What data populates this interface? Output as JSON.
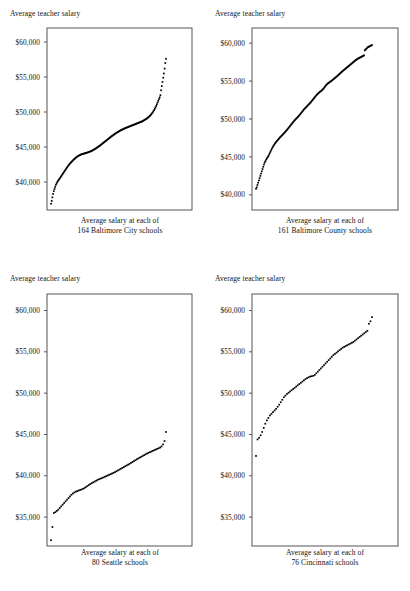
{
  "figure": {
    "background": "#ffffff",
    "ink": "#000000",
    "frame_color": "#555555",
    "panel_count": 4
  },
  "chart_data": [
    {
      "id": "baltimore-city",
      "type": "scatter",
      "title": "Average teacher salary",
      "ylabel": "Average teacher salary",
      "xlabel": "Average salary at each of 164 Baltimore City schools",
      "xlabel_line1": "Average salary at each of",
      "xlabel_line2": "164 Baltimore City schools",
      "n": 164,
      "city": "Baltimore City",
      "grid": false,
      "legend": "none",
      "ylim": [
        36000,
        62000
      ],
      "yticks": [
        40000,
        45000,
        50000,
        55000,
        60000
      ],
      "ytick_labels": [
        "$40,000",
        "$45,000",
        "$50,000",
        "$55,000",
        "$60,000"
      ],
      "x": [
        1,
        2,
        3,
        4,
        5,
        6,
        7,
        8,
        9,
        10,
        11,
        12,
        13,
        14,
        15,
        16,
        17,
        18,
        19,
        20,
        21,
        22,
        23,
        24,
        25,
        26,
        27,
        28,
        29,
        30,
        31,
        32,
        33,
        34,
        35,
        36,
        37,
        38,
        39,
        40,
        41,
        42,
        43,
        44,
        45,
        46,
        47,
        48,
        49,
        50,
        51,
        52,
        53,
        54,
        55,
        56,
        57,
        58,
        59,
        60,
        61,
        62,
        63,
        64,
        65,
        66,
        67,
        68,
        69,
        70,
        71,
        72,
        73,
        74,
        75,
        76,
        77,
        78,
        79,
        80,
        81,
        82,
        83,
        84,
        85,
        86,
        87,
        88,
        89,
        90,
        91,
        92,
        93,
        94,
        95,
        96,
        97,
        98,
        99,
        100,
        101,
        102,
        103,
        104,
        105,
        106,
        107,
        108,
        109,
        110,
        111,
        112,
        113,
        114,
        115,
        116,
        117,
        118,
        119,
        120,
        121,
        122,
        123,
        124,
        125,
        126,
        127,
        128,
        129,
        130,
        131,
        132,
        133,
        134,
        135,
        136,
        137,
        138,
        139,
        140,
        141,
        142,
        143,
        144,
        145,
        146,
        147,
        148,
        149,
        150,
        151,
        152,
        153,
        154,
        155,
        156,
        157,
        158,
        159,
        160,
        161,
        162,
        163,
        164
      ],
      "values": [
        36900,
        37300,
        37800,
        38300,
        38700,
        39000,
        39300,
        39600,
        39800,
        40000,
        40150,
        40300,
        40450,
        40600,
        40750,
        40900,
        41050,
        41200,
        41350,
        41500,
        41650,
        41800,
        41950,
        42100,
        42250,
        42380,
        42500,
        42620,
        42740,
        42850,
        42960,
        43060,
        43160,
        43260,
        43350,
        43440,
        43520,
        43600,
        43670,
        43730,
        43790,
        43840,
        43890,
        43930,
        43970,
        44000,
        44030,
        44060,
        44090,
        44120,
        44150,
        44180,
        44210,
        44240,
        44280,
        44320,
        44360,
        44400,
        44450,
        44500,
        44560,
        44620,
        44680,
        44740,
        44800,
        44870,
        44940,
        45010,
        45080,
        45150,
        45220,
        45300,
        45380,
        45460,
        45540,
        45620,
        45700,
        45780,
        45860,
        45940,
        46020,
        46100,
        46180,
        46260,
        46340,
        46420,
        46500,
        46580,
        46650,
        46720,
        46790,
        46860,
        46930,
        47000,
        47060,
        47120,
        47180,
        47240,
        47300,
        47360,
        47410,
        47460,
        47510,
        47560,
        47610,
        47660,
        47700,
        47740,
        47780,
        47820,
        47860,
        47900,
        47940,
        47980,
        48020,
        48060,
        48100,
        48140,
        48180,
        48220,
        48260,
        48300,
        48340,
        48380,
        48420,
        48460,
        48500,
        48540,
        48580,
        48620,
        48670,
        48720,
        48780,
        48840,
        48900,
        48960,
        49030,
        49100,
        49180,
        49260,
        49350,
        49450,
        49560,
        49680,
        49810,
        49950,
        50100,
        50270,
        50450,
        50650,
        50870,
        51100,
        51350,
        51600,
        51850,
        52100,
        52400,
        53100,
        53700,
        54300,
        54900,
        55500,
        56200,
        57000,
        57600
      ]
    },
    {
      "id": "baltimore-county",
      "type": "scatter",
      "title": "Average teacher salary",
      "ylabel": "Average teacher salary",
      "xlabel": "Average salary at each of 161 Baltimore County schools",
      "xlabel_line1": "Average salary at each of",
      "xlabel_line2": "161 Baltimore County schools",
      "n": 161,
      "city": "Baltimore County",
      "grid": false,
      "legend": "none",
      "ylim": [
        38000,
        62000
      ],
      "yticks": [
        40000,
        45000,
        50000,
        55000,
        60000
      ],
      "ytick_labels": [
        "$40,000",
        "$45,000",
        "$50,000",
        "$55,000",
        "$60,000"
      ],
      "x": [
        1,
        2,
        3,
        4,
        5,
        6,
        7,
        8,
        9,
        10,
        11,
        12,
        13,
        14,
        15,
        16,
        17,
        18,
        19,
        20,
        21,
        22,
        23,
        24,
        25,
        26,
        27,
        28,
        29,
        30,
        31,
        32,
        33,
        34,
        35,
        36,
        37,
        38,
        39,
        40,
        41,
        42,
        43,
        44,
        45,
        46,
        47,
        48,
        49,
        50,
        51,
        52,
        53,
        54,
        55,
        56,
        57,
        58,
        59,
        60,
        61,
        62,
        63,
        64,
        65,
        66,
        67,
        68,
        69,
        70,
        71,
        72,
        73,
        74,
        75,
        76,
        77,
        78,
        79,
        80,
        81,
        82,
        83,
        84,
        85,
        86,
        87,
        88,
        89,
        90,
        91,
        92,
        93,
        94,
        95,
        96,
        97,
        98,
        99,
        100,
        101,
        102,
        103,
        104,
        105,
        106,
        107,
        108,
        109,
        110,
        111,
        112,
        113,
        114,
        115,
        116,
        117,
        118,
        119,
        120,
        121,
        122,
        123,
        124,
        125,
        126,
        127,
        128,
        129,
        130,
        131,
        132,
        133,
        134,
        135,
        136,
        137,
        138,
        139,
        140,
        141,
        142,
        143,
        144,
        145,
        146,
        147,
        148,
        149,
        150,
        151,
        152,
        153,
        154,
        155,
        156,
        157,
        158,
        159,
        160,
        161
      ],
      "values": [
        40800,
        41000,
        41300,
        41600,
        41900,
        42200,
        42500,
        42800,
        43100,
        43400,
        43700,
        44000,
        44250,
        44450,
        44650,
        44800,
        44950,
        45100,
        45300,
        45500,
        45700,
        45900,
        46100,
        46280,
        46450,
        46600,
        46750,
        46880,
        47000,
        47120,
        47230,
        47340,
        47450,
        47560,
        47660,
        47760,
        47860,
        47960,
        48060,
        48160,
        48270,
        48380,
        48490,
        48600,
        48720,
        48840,
        48960,
        49080,
        49200,
        49320,
        49440,
        49560,
        49680,
        49800,
        49900,
        50000,
        50100,
        50200,
        50300,
        50400,
        50520,
        50640,
        50760,
        50880,
        51000,
        51120,
        51240,
        51350,
        51450,
        51550,
        51650,
        51750,
        51850,
        51950,
        52050,
        52150,
        52260,
        52380,
        52500,
        52620,
        52740,
        52860,
        52980,
        53100,
        53200,
        53300,
        53400,
        53480,
        53560,
        53640,
        53720,
        53800,
        53900,
        54000,
        54120,
        54250,
        54380,
        54500,
        54600,
        54680,
        54750,
        54820,
        54890,
        54960,
        55030,
        55100,
        55180,
        55260,
        55340,
        55420,
        55500,
        55580,
        55660,
        55750,
        55840,
        55930,
        56020,
        56110,
        56200,
        56280,
        56360,
        56440,
        56520,
        56600,
        56680,
        56760,
        56840,
        56920,
        57000,
        57080,
        57160,
        57240,
        57320,
        57400,
        57480,
        57560,
        57640,
        57720,
        57800,
        57860,
        57920,
        57980,
        58030,
        58080,
        58130,
        58180,
        58230,
        58280,
        58330,
        58400,
        59050,
        59150,
        59250,
        59350,
        59450,
        59500,
        59550,
        59600,
        59650,
        59700,
        59750
      ]
    },
    {
      "id": "seattle",
      "type": "scatter",
      "title": "Average teacher salary",
      "ylabel": "Average teacher salary",
      "xlabel": "Average salary at each of 80 Seattle schools",
      "xlabel_line1": "Average salary at each of",
      "xlabel_line2": "80 Seattle schools",
      "n": 80,
      "city": "Seattle",
      "grid": false,
      "legend": "none",
      "ylim": [
        31500,
        62000
      ],
      "yticks": [
        35000,
        40000,
        45000,
        50000,
        55000,
        60000
      ],
      "ytick_labels": [
        "$35,000",
        "$40,000",
        "$45,000",
        "$50,000",
        "$55,000",
        "$60,000"
      ],
      "x": [
        1,
        2,
        3,
        4,
        5,
        6,
        7,
        8,
        9,
        10,
        11,
        12,
        13,
        14,
        15,
        16,
        17,
        18,
        19,
        20,
        21,
        22,
        23,
        24,
        25,
        26,
        27,
        28,
        29,
        30,
        31,
        32,
        33,
        34,
        35,
        36,
        37,
        38,
        39,
        40,
        41,
        42,
        43,
        44,
        45,
        46,
        47,
        48,
        49,
        50,
        51,
        52,
        53,
        54,
        55,
        56,
        57,
        58,
        59,
        60,
        61,
        62,
        63,
        64,
        65,
        66,
        67,
        68,
        69,
        70,
        71,
        72,
        73,
        74,
        75,
        76,
        77,
        78,
        79,
        80
      ],
      "values": [
        32200,
        33800,
        35500,
        35600,
        35750,
        35900,
        36100,
        36300,
        36500,
        36700,
        36900,
        37100,
        37300,
        37500,
        37700,
        37850,
        37980,
        38080,
        38150,
        38220,
        38280,
        38340,
        38420,
        38520,
        38640,
        38760,
        38880,
        39000,
        39100,
        39200,
        39300,
        39400,
        39500,
        39580,
        39650,
        39720,
        39800,
        39880,
        39960,
        40040,
        40120,
        40200,
        40280,
        40360,
        40450,
        40550,
        40650,
        40750,
        40850,
        40950,
        41050,
        41150,
        41250,
        41350,
        41450,
        41560,
        41670,
        41780,
        41890,
        42000,
        42100,
        42200,
        42300,
        42400,
        42500,
        42600,
        42700,
        42780,
        42860,
        42940,
        43020,
        43100,
        43180,
        43260,
        43340,
        43420,
        43560,
        43800,
        44200,
        45300
      ]
    },
    {
      "id": "cincinnati",
      "type": "scatter",
      "title": "Average teacher salary",
      "ylabel": "Average teacher salary",
      "xlabel": "Average salary at each of 76 Cincinnati schools",
      "xlabel_line1": "Average salary at each of",
      "xlabel_line2": "76 Cincinnati schools",
      "n": 76,
      "city": "Cincinnati",
      "grid": false,
      "legend": "none",
      "ylim": [
        31500,
        62000
      ],
      "yticks": [
        35000,
        40000,
        45000,
        50000,
        55000,
        60000
      ],
      "ytick_labels": [
        "$35,000",
        "$40,000",
        "$45,000",
        "$50,000",
        "$55,000",
        "$60,000"
      ],
      "x": [
        1,
        2,
        3,
        4,
        5,
        6,
        7,
        8,
        9,
        10,
        11,
        12,
        13,
        14,
        15,
        16,
        17,
        18,
        19,
        20,
        21,
        22,
        23,
        24,
        25,
        26,
        27,
        28,
        29,
        30,
        31,
        32,
        33,
        34,
        35,
        36,
        37,
        38,
        39,
        40,
        41,
        42,
        43,
        44,
        45,
        46,
        47,
        48,
        49,
        50,
        51,
        52,
        53,
        54,
        55,
        56,
        57,
        58,
        59,
        60,
        61,
        62,
        63,
        64,
        65,
        66,
        67,
        68,
        69,
        70,
        71,
        72,
        73,
        74,
        75,
        76
      ],
      "values": [
        42400,
        44400,
        44600,
        44900,
        45300,
        45800,
        46300,
        46700,
        47000,
        47300,
        47500,
        47700,
        47900,
        48100,
        48350,
        48600,
        48900,
        49200,
        49500,
        49700,
        49900,
        50050,
        50200,
        50350,
        50500,
        50650,
        50800,
        50950,
        51100,
        51250,
        51400,
        51550,
        51700,
        51820,
        51920,
        52000,
        52050,
        52100,
        52200,
        52400,
        52600,
        52800,
        53000,
        53200,
        53400,
        53600,
        53800,
        54000,
        54200,
        54400,
        54600,
        54750,
        54900,
        55050,
        55200,
        55350,
        55500,
        55600,
        55700,
        55800,
        55900,
        56000,
        56100,
        56200,
        56350,
        56500,
        56650,
        56800,
        56950,
        57100,
        57250,
        57400,
        57550,
        58400,
        58700,
        59200
      ]
    }
  ]
}
